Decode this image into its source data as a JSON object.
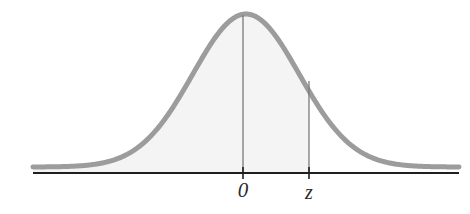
{
  "figure": {
    "background_color": "#ffffff",
    "width": 470,
    "height": 214
  },
  "axis": {
    "name": "horizontal-axis",
    "color": "#1f1f1f",
    "stroke_width": 2,
    "x_start": 33,
    "x_end": 459,
    "y": 173
  },
  "ticks": [
    {
      "label": "0",
      "x": 243,
      "color": "#2b2b2b"
    },
    {
      "label": "z",
      "x": 309,
      "color": "#2b2b2b"
    }
  ],
  "curve": {
    "name": "normal-density-curve",
    "stroke_color": "#9c9c9c",
    "stroke_width": 5,
    "peak_x": 243,
    "peak_y": 14,
    "baseline_y": 167
  },
  "shaded_region": {
    "name": "cumulative-area-shading",
    "fill_color": "#f4f4f4",
    "from_x": 33,
    "to_x": 309
  },
  "vertical_lines": [
    {
      "name": "mean-line",
      "x": 243,
      "top_y": 15,
      "bottom_y": 173,
      "color": "#7a7a7a"
    },
    {
      "name": "z-line",
      "x": 309,
      "top_y": 81,
      "bottom_y": 173,
      "color": "#7a7a7a"
    }
  ],
  "chart_data": {
    "type": "line",
    "title": "",
    "xlabel": "",
    "ylabel": "",
    "distribution": "standard normal",
    "mean": 0,
    "standard_deviation": 1,
    "tick_labels": [
      "0",
      "z"
    ],
    "tick_values": [
      0,
      1.0
    ],
    "shaded_area_description": "area under the curve to the left of z",
    "grid": false,
    "legend": "none",
    "x": [
      -4.0,
      -3.5,
      -3.0,
      -2.5,
      -2.0,
      -1.5,
      -1.0,
      -0.5,
      0.0,
      0.5,
      1.0,
      1.5,
      2.0,
      2.5,
      3.0,
      3.5,
      4.0
    ],
    "y": [
      0.0,
      0.002,
      0.004,
      0.018,
      0.054,
      0.13,
      0.242,
      0.352,
      0.399,
      0.352,
      0.242,
      0.13,
      0.054,
      0.018,
      0.004,
      0.002,
      0.0
    ],
    "xlim": [
      -4.0,
      4.0
    ],
    "ylim": [
      0.0,
      0.42
    ]
  }
}
